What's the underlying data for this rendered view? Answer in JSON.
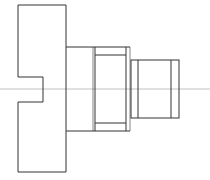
{
  "drawing": {
    "type": "technical-drawing-side-view",
    "colors": {
      "outline": "#333333",
      "centerline": "#888888",
      "background": "#ffffff"
    },
    "parts": {
      "flange": {
        "x1": 18,
        "y1": 5,
        "x2": 66,
        "y2": 172,
        "notch": {
          "y1": 77,
          "y2": 102,
          "depth_x": 43
        }
      },
      "middle_section": {
        "x1": 66,
        "y1": 47,
        "x2": 130,
        "y2": 131,
        "inner_top_y": 55,
        "inner_bottom_y": 123,
        "inner_x": [
          93,
          95,
          126
        ]
      },
      "end_section": {
        "x1": 131,
        "y1": 60,
        "x2": 179,
        "y2": 118,
        "inner_x": [
          138,
          171
        ]
      },
      "centerline_y": 89
    }
  }
}
